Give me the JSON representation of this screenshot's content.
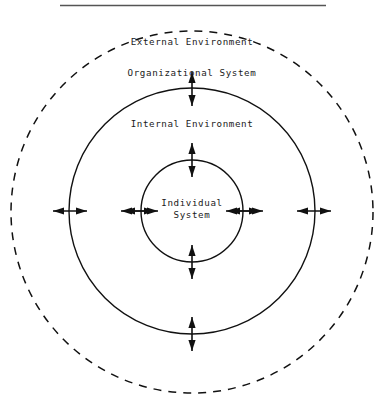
{
  "diagram": {
    "title_rule": {
      "name": "top-horizontal-rule",
      "color": "#555555"
    },
    "colors": {
      "stroke": "#111111",
      "dashed_stroke": "#111111",
      "text": "#1a1a1a",
      "rule": "#555555",
      "background": "#ffffff"
    },
    "geometry": {
      "center_x": 192,
      "center_y": 212,
      "outer_dashed_radius": 181,
      "organizational_radius": 123,
      "individual_radius": 51
    },
    "rings": [
      {
        "id": "external-environment",
        "label": "External Environment",
        "style": "dashed",
        "label_x": 192,
        "label_y": 42
      },
      {
        "id": "organizational-system",
        "label": "Organizational System",
        "style": "solid",
        "label_x": 192,
        "label_y": 73
      },
      {
        "id": "internal-environment",
        "label": "Internal Environment",
        "style": "none",
        "label_x": 192,
        "label_y": 124
      },
      {
        "id": "individual-system",
        "label_line1": "Individual",
        "label_line2": "System",
        "style": "solid",
        "label_x": 192,
        "label_y": 202
      }
    ],
    "arrows": {
      "description": "double-headed arrows crossing each circle boundary",
      "count_per_side": 3,
      "left": [
        {
          "name": "arrow-left-outer-dashed",
          "cx": 70,
          "cy": 211
        },
        {
          "name": "arrow-left-organizational",
          "cx": 138,
          "cy": 211
        },
        {
          "name": "arrow-left-individual",
          "cx": 192,
          "cy": 211
        }
      ],
      "right": [
        {
          "name": "arrow-right-individual",
          "cx": 192,
          "cy": 211
        },
        {
          "name": "arrow-right-organizational",
          "cx": 246,
          "cy": 211
        },
        {
          "name": "arrow-right-outer-dashed",
          "cx": 314,
          "cy": 211
        }
      ],
      "vertical": [
        {
          "name": "arrow-top-organizational",
          "cx": 192,
          "cy": 89
        },
        {
          "name": "arrow-top-individual",
          "cx": 192,
          "cy": 160
        },
        {
          "name": "arrow-bottom-individual",
          "cx": 192,
          "cy": 262
        },
        {
          "name": "arrow-bottom-organizational",
          "cx": 192,
          "cy": 334
        }
      ]
    }
  }
}
